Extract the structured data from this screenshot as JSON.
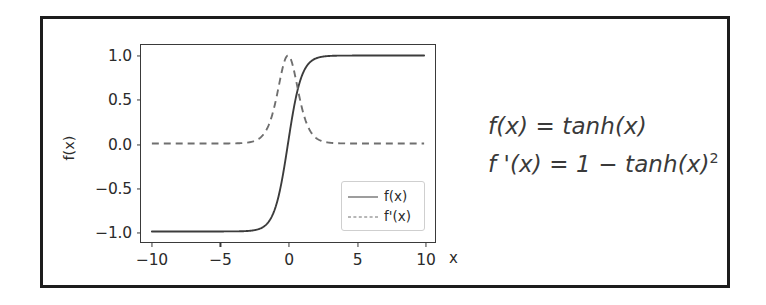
{
  "figure": {
    "frame_color": "#1d1d1d",
    "background": "#ffffff"
  },
  "chart_data": {
    "type": "line",
    "title": "",
    "xlabel": "x",
    "ylabel": "f(x)",
    "xlim": [
      -10.8,
      10.8
    ],
    "ylim": [
      -1.12,
      1.12
    ],
    "grid": false,
    "legend_position": "lower right",
    "x_ticks": [
      "-10",
      "-5",
      "0",
      "5",
      "10"
    ],
    "x_tick_values": [
      -10,
      -5,
      0,
      5,
      10
    ],
    "y_ticks": [
      "1.0",
      "0.5",
      "0.0",
      "-0.5",
      "-1.0"
    ],
    "y_tick_values": [
      1.0,
      0.5,
      0.0,
      -0.5,
      -1.0
    ],
    "series": [
      {
        "name": "f(x)",
        "style": "solid",
        "color": "#3c3c3c",
        "formula": "tanh(x)",
        "x": [
          -10,
          -9,
          -8,
          -7,
          -6,
          -5,
          -4,
          -3,
          -2.5,
          -2,
          -1.5,
          -1,
          -0.5,
          0,
          0.5,
          1,
          1.5,
          2,
          2.5,
          3,
          4,
          5,
          6,
          7,
          8,
          9,
          10
        ],
        "values": [
          -1.0,
          -1.0,
          -1.0,
          -1.0,
          -0.99999,
          -0.9999,
          -0.9993,
          -0.995,
          -0.9866,
          -0.964,
          -0.9051,
          -0.7616,
          -0.4621,
          0.0,
          0.4621,
          0.7616,
          0.9051,
          0.964,
          0.9866,
          0.995,
          0.9993,
          0.9999,
          0.99999,
          1.0,
          1.0,
          1.0,
          1.0
        ]
      },
      {
        "name": "f'(x)",
        "style": "dashed",
        "color": "#6f6f6f",
        "formula": "1 - tanh(x)^2",
        "x": [
          -10,
          -9,
          -8,
          -7,
          -6,
          -5,
          -4,
          -3,
          -2.5,
          -2,
          -1.5,
          -1,
          -0.5,
          0,
          0.5,
          1,
          1.5,
          2,
          2.5,
          3,
          4,
          5,
          6,
          7,
          8,
          9,
          10
        ],
        "values": [
          0.0,
          0.0,
          0.0,
          0.0,
          2e-05,
          0.00018,
          0.00134,
          0.00987,
          0.02658,
          0.07065,
          0.1807,
          0.41997,
          0.78645,
          1.0,
          0.78645,
          0.41997,
          0.1807,
          0.07065,
          0.02658,
          0.00987,
          0.00134,
          0.00018,
          2e-05,
          0.0,
          0.0,
          0.0,
          0.0
        ]
      }
    ],
    "legend_entries": [
      "f(x)",
      "f'(x)"
    ]
  },
  "legend": {
    "entries": [
      {
        "label": "f(x)"
      },
      {
        "label": "f'(x)"
      }
    ]
  },
  "equations": [
    {
      "lhs": "f(x)",
      "eq": "=",
      "rhs": "tanh(x)",
      "sup": "",
      "text": "f(x) = tanh(x)"
    },
    {
      "lhs": "f '(x)",
      "eq": "=",
      "rhs": "1 − tanh(x)",
      "sup": "2",
      "text": "f '(x) = 1 − tanh(x)2"
    }
  ]
}
